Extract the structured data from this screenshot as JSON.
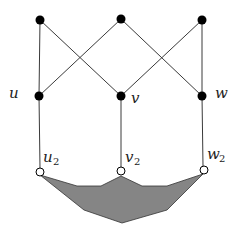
{
  "diagram": {
    "labels": {
      "u": "u",
      "v": "v",
      "w": "w",
      "u2_base": "u",
      "u2_sub": "2",
      "v2_base": "v",
      "v2_sub": "2",
      "w2_base": "w",
      "w2_sub": "2"
    },
    "colors": {
      "edge": "#3a3a3a",
      "filled_node": "#000000",
      "open_node_fill": "#ffffff",
      "region_fill": "#858585"
    },
    "nodes": [
      {
        "id": "t1",
        "x": 40,
        "y": 20,
        "type": "filled"
      },
      {
        "id": "t2",
        "x": 121,
        "y": 19,
        "type": "filled"
      },
      {
        "id": "t3",
        "x": 202,
        "y": 20,
        "type": "filled"
      },
      {
        "id": "u",
        "x": 39,
        "y": 96,
        "type": "filled"
      },
      {
        "id": "v",
        "x": 121,
        "y": 96,
        "type": "filled"
      },
      {
        "id": "w",
        "x": 202,
        "y": 96,
        "type": "filled"
      },
      {
        "id": "u2",
        "x": 40,
        "y": 172,
        "type": "open"
      },
      {
        "id": "v2",
        "x": 121,
        "y": 171,
        "type": "open"
      },
      {
        "id": "w2",
        "x": 204,
        "y": 170,
        "type": "open"
      }
    ],
    "edges": [
      [
        "t1",
        "u"
      ],
      [
        "t1",
        "v"
      ],
      [
        "t2",
        "u"
      ],
      [
        "t2",
        "w"
      ],
      [
        "t3",
        "v"
      ],
      [
        "t3",
        "w"
      ],
      [
        "u",
        "u2"
      ],
      [
        "v",
        "v2"
      ],
      [
        "w",
        "w2"
      ]
    ],
    "region": "shaded polygon attached to u2, v2, w2"
  }
}
